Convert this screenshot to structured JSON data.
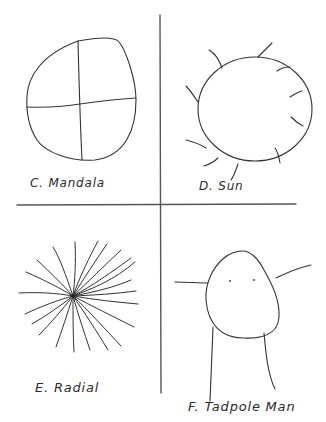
{
  "diagram": {
    "ink_color": "#333333",
    "panels": [
      {
        "id": "C",
        "label": "C. Mandala",
        "description": "rounded shape divided into four by a cross"
      },
      {
        "id": "D",
        "label": "D. Sun",
        "description": "oval with short rays around the edge"
      },
      {
        "id": "E",
        "label": "E. Radial",
        "description": "lines radiating from a central point"
      },
      {
        "id": "F",
        "label": "F. Tadpole Man",
        "description": "oval head with two dot eyes, arms and legs extending from head"
      }
    ],
    "dividers": {
      "vertical": {
        "x": 160,
        "y1": 14,
        "y2": 393
      },
      "horizontal": {
        "y": 205,
        "x1": 18,
        "x2": 296
      }
    }
  }
}
